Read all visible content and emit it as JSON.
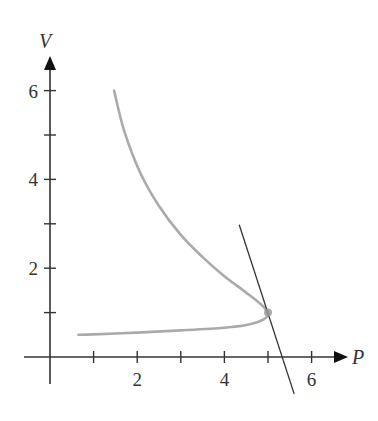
{
  "chart_data": {
    "type": "line",
    "title": "",
    "xlabel": "P",
    "ylabel": "V",
    "xlim": [
      0,
      7
    ],
    "ylim": [
      0,
      7
    ],
    "x_ticks": [
      1,
      2,
      3,
      4,
      5,
      6
    ],
    "x_tick_labels": [
      "",
      "2",
      "",
      "4",
      "",
      "6"
    ],
    "y_ticks": [
      1,
      2,
      3,
      4,
      5,
      6
    ],
    "y_tick_labels": [
      "",
      "2",
      "",
      "4",
      "",
      "6"
    ],
    "grid": false,
    "legend": null,
    "series": [
      {
        "name": "curve",
        "color": "#aaaaaa",
        "points": [
          [
            1.47,
            6.0
          ],
          [
            1.7,
            5.1
          ],
          [
            2.07,
            4.15
          ],
          [
            2.5,
            3.4
          ],
          [
            3.0,
            2.75
          ],
          [
            3.5,
            2.25
          ],
          [
            4.0,
            1.82
          ],
          [
            4.5,
            1.45
          ],
          [
            4.82,
            1.2
          ],
          [
            5.0,
            1.0
          ],
          [
            4.9,
            0.85
          ],
          [
            4.5,
            0.72
          ],
          [
            4.0,
            0.66
          ],
          [
            3.0,
            0.6
          ],
          [
            2.0,
            0.55
          ],
          [
            1.0,
            0.51
          ],
          [
            0.65,
            0.5
          ]
        ]
      },
      {
        "name": "tangent-line",
        "color": "#333333",
        "points": [
          [
            4.34,
            2.98
          ],
          [
            5.6,
            -0.83
          ]
        ]
      }
    ],
    "annotations": [
      {
        "type": "point",
        "x": 5.0,
        "y": 1.0,
        "color": "#999999"
      }
    ]
  }
}
